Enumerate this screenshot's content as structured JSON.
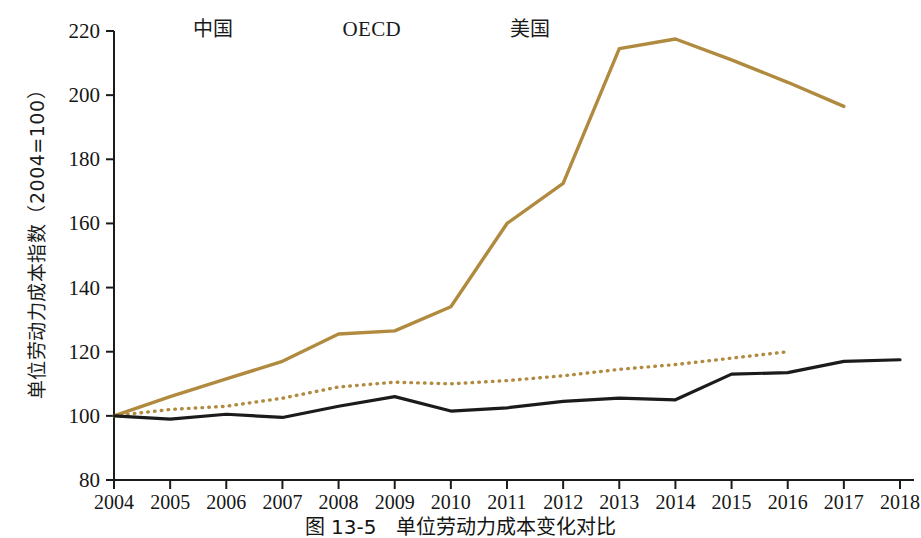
{
  "figure": {
    "caption": "图 13-5　单位劳动力成本变化对比",
    "colors": {
      "gold": "#b08a3e",
      "black": "#1b1b1b",
      "axis": "#1b1b1b",
      "background": "#ffffff"
    }
  },
  "legend": {
    "position": "top-left",
    "items": [
      {
        "label": "中国",
        "style": "solid",
        "color": "#b08a3e",
        "swatch": "solid-gold-line-icon"
      },
      {
        "label": "OECD",
        "style": "dotted",
        "color": "#b08a3e",
        "swatch": "dotted-gold-line-icon"
      },
      {
        "label": "美国",
        "style": "solid",
        "color": "#1b1b1b",
        "swatch": "solid-black-line-icon"
      }
    ]
  },
  "chart_data": {
    "type": "line",
    "title": "",
    "xlabel": "",
    "ylabel": "单位劳动力成本指数（2004=100）",
    "x": [
      2004,
      2005,
      2006,
      2007,
      2008,
      2009,
      2010,
      2011,
      2012,
      2013,
      2014,
      2015,
      2016,
      2017,
      2018
    ],
    "xtick_labels": [
      "2004",
      "2005",
      "2006",
      "2007",
      "2008",
      "2009",
      "2010",
      "2011",
      "2012",
      "2013",
      "2014",
      "2015",
      "2016",
      "2017",
      "2018"
    ],
    "ytick_labels": [
      "80",
      "100",
      "120",
      "140",
      "160",
      "180",
      "200",
      "220"
    ],
    "yticks": [
      80,
      100,
      120,
      140,
      160,
      180,
      200,
      220
    ],
    "xlim": [
      2004,
      2018
    ],
    "ylim": [
      80,
      220
    ],
    "grid": false,
    "legend_position": "top-left",
    "series": [
      {
        "name": "中国",
        "color": "#b08a3e",
        "style": "solid",
        "x": [
          2004,
          2005,
          2006,
          2007,
          2008,
          2009,
          2010,
          2011,
          2012,
          2013,
          2014,
          2015,
          2016,
          2017
        ],
        "values": [
          100,
          106,
          111.5,
          117,
          125.5,
          126.5,
          134,
          160,
          172.5,
          214.5,
          217.5,
          211,
          204,
          196.5
        ]
      },
      {
        "name": "OECD",
        "color": "#b08a3e",
        "style": "dotted",
        "x": [
          2004,
          2005,
          2006,
          2007,
          2008,
          2009,
          2010,
          2011,
          2012,
          2013,
          2014,
          2015,
          2016
        ],
        "values": [
          100,
          102,
          103,
          105.5,
          109,
          110.5,
          110,
          111,
          112.5,
          114.5,
          116,
          118,
          120
        ]
      },
      {
        "name": "美国",
        "color": "#1b1b1b",
        "style": "solid",
        "x": [
          2004,
          2005,
          2006,
          2007,
          2008,
          2009,
          2010,
          2011,
          2012,
          2013,
          2014,
          2015,
          2016,
          2017,
          2018
        ],
        "values": [
          100,
          99,
          100.5,
          99.5,
          103,
          106,
          101.5,
          102.5,
          104.5,
          105.5,
          105,
          113,
          113.5,
          117,
          117.5
        ]
      }
    ]
  }
}
